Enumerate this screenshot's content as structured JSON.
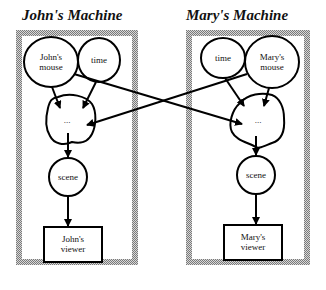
{
  "machines": [
    {
      "title": "John's Machine",
      "nodes": {
        "mouse": "John's\nmouse",
        "mouse_line1": "John's",
        "mouse_line2": "mouse",
        "time": "time",
        "process": "...",
        "scene": "scene",
        "viewer_line1": "John's",
        "viewer_line2": "viewer"
      }
    },
    {
      "title": "Mary's Machine",
      "nodes": {
        "mouse_line1": "Mary's",
        "mouse_line2": "mouse",
        "time": "time",
        "process": "...",
        "scene": "scene",
        "viewer_line1": "Mary's",
        "viewer_line2": "viewer"
      }
    }
  ],
  "edges": [
    {
      "from": "John's mouse",
      "to": "John's process"
    },
    {
      "from": "John's time",
      "to": "John's process"
    },
    {
      "from": "John's mouse",
      "to": "Mary's process"
    },
    {
      "from": "Mary's mouse",
      "to": "Mary's process"
    },
    {
      "from": "Mary's time",
      "to": "Mary's process"
    },
    {
      "from": "Mary's mouse",
      "to": "John's process"
    },
    {
      "from": "John's process",
      "to": "John's scene"
    },
    {
      "from": "John's scene",
      "to": "John's viewer"
    },
    {
      "from": "Mary's process",
      "to": "Mary's scene"
    },
    {
      "from": "Mary's scene",
      "to": "Mary's viewer"
    }
  ]
}
